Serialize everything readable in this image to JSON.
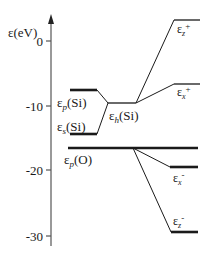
{
  "axis": {
    "label": "ε(eV)",
    "ticks": [
      {
        "value": 0,
        "label": "0"
      },
      {
        "value": -10,
        "label": "-10"
      },
      {
        "value": -20,
        "label": "-20"
      },
      {
        "value": -30,
        "label": "-30"
      }
    ]
  },
  "levels": {
    "ep_si": {
      "label_main": "ε",
      "label_sub": "p",
      "label_suffix": "(Si)"
    },
    "es_si": {
      "label_main": "ε",
      "label_sub": "s",
      "label_suffix": "(Si)"
    },
    "eh_si": {
      "label_main": "ε",
      "label_sub": "h",
      "label_suffix": "(Si)"
    },
    "ep_o": {
      "label_main": "ε",
      "label_sub": "p",
      "label_suffix": "(O)"
    },
    "ez_plus": {
      "label_main": "ε",
      "label_sub": "z",
      "label_sup": "+"
    },
    "ex_plus": {
      "label_main": "ε",
      "label_sub": "x",
      "label_sup": "+"
    },
    "ex_minus": {
      "label_main": "ε",
      "label_sub": "x",
      "label_sup": "-"
    },
    "ez_minus": {
      "label_main": "ε",
      "label_sub": "z",
      "label_sup": "-"
    }
  },
  "colors": {
    "line": "#1a1a1a",
    "axis": "#555555"
  }
}
